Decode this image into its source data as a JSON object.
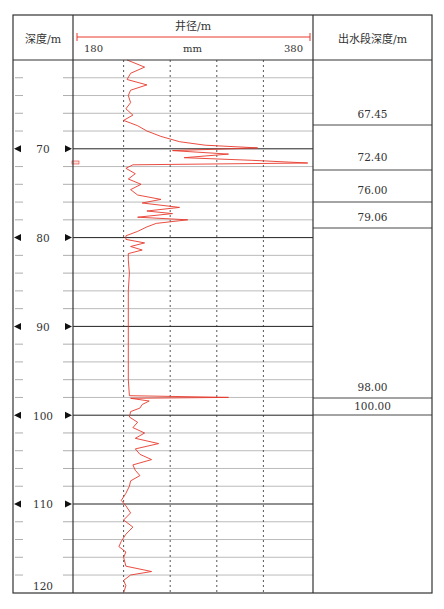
{
  "header": {
    "depth_col": "深度/m",
    "caliper_title": "井径/m",
    "scale_min": "180",
    "scale_unit": "mm",
    "scale_max": "380",
    "water_col": "出水段深度/m"
  },
  "depth_labels": [
    "70",
    "80",
    "90",
    "100",
    "110",
    "120"
  ],
  "water_depths": [
    "67.45",
    "72.40",
    "76.00",
    "79.06",
    "98.00",
    "100.00"
  ],
  "colors": {
    "curve": "#e8392b",
    "grid": "#999999",
    "frame": "#333333"
  },
  "chart_data": {
    "type": "line",
    "title": "井径/m",
    "xlabel": "mm",
    "ylabel": "深度/m",
    "xlim": [
      180,
      380
    ],
    "ylim": [
      60,
      120
    ],
    "y_inverted": true,
    "grid": true,
    "dashed_vertical_gridlines_mm": [
      220,
      260,
      300,
      340
    ],
    "depth_ticks": [
      70,
      80,
      90,
      100,
      110,
      120
    ],
    "water_producing_depths_m": [
      67.45,
      72.4,
      76.0,
      79.06,
      98.0,
      100.0
    ],
    "series": [
      {
        "name": "井径 (caliper)",
        "points_depth_diameter_mm": [
          [
            60.0,
            223
          ],
          [
            60.8,
            238
          ],
          [
            61.5,
            226
          ],
          [
            62.2,
            223
          ],
          [
            62.8,
            240
          ],
          [
            63.4,
            226
          ],
          [
            64.0,
            224
          ],
          [
            64.8,
            226
          ],
          [
            65.5,
            222
          ],
          [
            66.2,
            228
          ],
          [
            66.8,
            220
          ],
          [
            67.4,
            232
          ],
          [
            68.0,
            240
          ],
          [
            68.6,
            252
          ],
          [
            69.2,
            268
          ],
          [
            69.6,
            290
          ],
          [
            69.9,
            335
          ],
          [
            70.2,
            262
          ],
          [
            70.6,
            310
          ],
          [
            71.0,
            272
          ],
          [
            71.3,
            330
          ],
          [
            71.6,
            378
          ],
          [
            71.8,
            228
          ],
          [
            72.2,
            222
          ],
          [
            72.8,
            230
          ],
          [
            73.4,
            224
          ],
          [
            74.0,
            235
          ],
          [
            74.6,
            226
          ],
          [
            75.2,
            232
          ],
          [
            75.7,
            252
          ],
          [
            76.1,
            236
          ],
          [
            76.6,
            268
          ],
          [
            77.0,
            240
          ],
          [
            77.3,
            262
          ],
          [
            77.7,
            232
          ],
          [
            78.0,
            275
          ],
          [
            78.4,
            248
          ],
          [
            78.8,
            240
          ],
          [
            79.3,
            232
          ],
          [
            79.8,
            222
          ],
          [
            80.2,
            222
          ],
          [
            80.6,
            238
          ],
          [
            81.0,
            226
          ],
          [
            81.4,
            236
          ],
          [
            81.8,
            224
          ],
          [
            82.5,
            224
          ],
          [
            84.0,
            225
          ],
          [
            86.0,
            224
          ],
          [
            88.0,
            224
          ],
          [
            90.0,
            224
          ],
          [
            92.0,
            224
          ],
          [
            94.0,
            224
          ],
          [
            96.0,
            224
          ],
          [
            97.8,
            225
          ],
          [
            98.0,
            310
          ],
          [
            98.1,
            226
          ],
          [
            98.4,
            242
          ],
          [
            98.8,
            236
          ],
          [
            99.2,
            234
          ],
          [
            99.6,
            226
          ],
          [
            100.2,
            225
          ],
          [
            100.8,
            232
          ],
          [
            101.4,
            228
          ],
          [
            102.0,
            238
          ],
          [
            102.6,
            230
          ],
          [
            103.2,
            250
          ],
          [
            103.8,
            230
          ],
          [
            104.4,
            234
          ],
          [
            105.0,
            244
          ],
          [
            105.6,
            228
          ],
          [
            106.2,
            230
          ],
          [
            106.8,
            234
          ],
          [
            107.4,
            226
          ],
          [
            108.0,
            225
          ],
          [
            108.8,
            222
          ],
          [
            109.6,
            218
          ],
          [
            110.2,
            222
          ],
          [
            111.0,
            226
          ],
          [
            111.8,
            220
          ],
          [
            112.6,
            228
          ],
          [
            113.4,
            222
          ],
          [
            114.2,
            218
          ],
          [
            114.8,
            216
          ],
          [
            115.4,
            222
          ],
          [
            116.0,
            220
          ],
          [
            117.0,
            222
          ],
          [
            117.6,
            244
          ],
          [
            118.0,
            226
          ],
          [
            118.6,
            220
          ],
          [
            119.2,
            222
          ],
          [
            120.0,
            220
          ]
        ]
      }
    ]
  }
}
